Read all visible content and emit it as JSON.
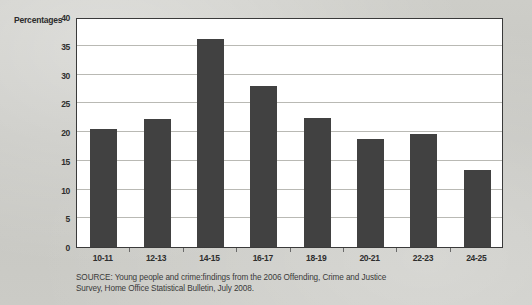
{
  "chart_data": {
    "type": "bar",
    "title": "",
    "xlabel": "",
    "ylabel": "Percentages",
    "categories": [
      "10-11",
      "12-13",
      "14-15",
      "16-17",
      "18-19",
      "20-21",
      "22-23",
      "24-25"
    ],
    "values": [
      20.5,
      22.3,
      36.2,
      28.0,
      22.4,
      18.7,
      19.7,
      13.4
    ],
    "ylim": [
      0,
      40
    ],
    "yticks": [
      0,
      5,
      10,
      15,
      20,
      25,
      30,
      35,
      40
    ],
    "ytick_labels": [
      "0",
      "5",
      "10",
      "15",
      "20",
      "25",
      "30",
      "35",
      "40"
    ],
    "grid": true,
    "legend": false,
    "bar_color": "#414141",
    "plot_background": "#ffffff",
    "page_background": "#c8c8c3",
    "gridline_color": "#b9b9b4",
    "axis_color": "#3a3a3a"
  },
  "source": {
    "line1": "SOURCE: Young people and crime:findings from the 2006 Offending, Crime and Justice",
    "line2": "Survey, Home Office Statistical Bulletin, July 2008."
  }
}
